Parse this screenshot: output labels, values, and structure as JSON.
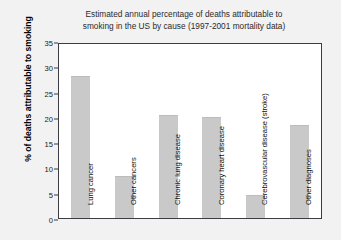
{
  "chart_data": {
    "type": "bar",
    "title": "Estimated annual percentage of deaths attributable to\nsmoking in the US by cause (1997-2001 mortality data)",
    "xlabel": "",
    "ylabel": "% of deaths attributable to smoking",
    "categories": [
      "Lung cancer",
      "Other cancers",
      "Chronic lung disease",
      "Coronary heart disease",
      "Cerebrovascular disease (stroke)",
      "Other diagnoses"
    ],
    "values": [
      29,
      8.5,
      21,
      20.5,
      4.5,
      19
    ],
    "ylim": [
      0,
      35
    ],
    "yticks": [
      0,
      5,
      10,
      15,
      20,
      25,
      30,
      35
    ],
    "ytick_labels": [
      "0",
      "5",
      "10",
      "15",
      "20",
      "25",
      "30",
      "35"
    ],
    "grid": false,
    "legend": "none",
    "bar_color": "#c9c9c9",
    "plot_background": "#ffffff",
    "figure_background": "#f2f2f2",
    "axis_color": "#3c3c45"
  }
}
